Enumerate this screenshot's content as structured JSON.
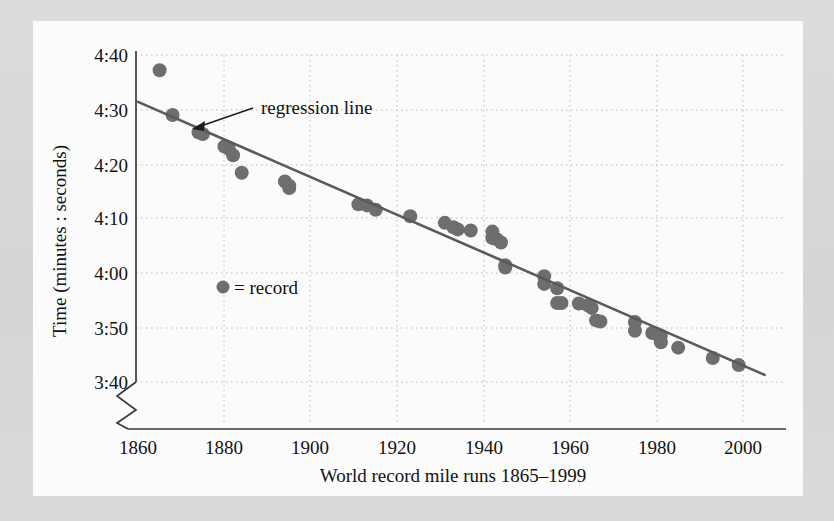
{
  "figure": {
    "panel_background": "#fbfbfb",
    "page_background": "#d9d9d9"
  },
  "chart_data": {
    "type": "scatter",
    "title": "",
    "xlabel": "World record mile runs 1865–1999",
    "ylabel": "Time (minutes : seconds)",
    "xlim": [
      1858,
      2006
    ],
    "ylim": [
      218,
      282
    ],
    "ylim_note": "y values in seconds; 3:40 = 220 s, 4:40 = 280 s",
    "grid": true,
    "grid_style": "dotted",
    "y_axis_break": true,
    "xticks": [
      1860,
      1880,
      1900,
      1920,
      1940,
      1960,
      1980,
      2000
    ],
    "xticklabels": [
      "1860",
      "1880",
      "1900",
      "1920",
      "1940",
      "1960",
      "1980",
      "2000"
    ],
    "yticks": [
      280,
      270,
      260,
      250,
      240,
      230,
      220
    ],
    "yticklabels": [
      "4:40",
      "4:30",
      "4:20",
      "4:10",
      "4:00",
      "3:50",
      "3:40"
    ],
    "marker_color": "#6e6e6e",
    "line_color": "#5a5a5a",
    "series": [
      {
        "name": "record",
        "marker": "filled-circle",
        "points": [
          {
            "x": 1865,
            "y": 277.2
          },
          {
            "x": 1868,
            "y": 269.0
          },
          {
            "x": 1874,
            "y": 265.8
          },
          {
            "x": 1875,
            "y": 265.5
          },
          {
            "x": 1880,
            "y": 263.2
          },
          {
            "x": 1881,
            "y": 262.8
          },
          {
            "x": 1882,
            "y": 261.6
          },
          {
            "x": 1884,
            "y": 258.4
          },
          {
            "x": 1894,
            "y": 256.8
          },
          {
            "x": 1895,
            "y": 256.0
          },
          {
            "x": 1895,
            "y": 255.6
          },
          {
            "x": 1911,
            "y": 252.6
          },
          {
            "x": 1913,
            "y": 252.4
          },
          {
            "x": 1915,
            "y": 251.6
          },
          {
            "x": 1923,
            "y": 250.4
          },
          {
            "x": 1931,
            "y": 249.2
          },
          {
            "x": 1933,
            "y": 248.4
          },
          {
            "x": 1934,
            "y": 248.0
          },
          {
            "x": 1937,
            "y": 247.8
          },
          {
            "x": 1942,
            "y": 247.6
          },
          {
            "x": 1942,
            "y": 246.4
          },
          {
            "x": 1943,
            "y": 246.2
          },
          {
            "x": 1944,
            "y": 245.6
          },
          {
            "x": 1945,
            "y": 241.4
          },
          {
            "x": 1945,
            "y": 241.0
          },
          {
            "x": 1954,
            "y": 239.4
          },
          {
            "x": 1954,
            "y": 238.0
          },
          {
            "x": 1957,
            "y": 237.2
          },
          {
            "x": 1957,
            "y": 234.5
          },
          {
            "x": 1958,
            "y": 234.5
          },
          {
            "x": 1962,
            "y": 234.4
          },
          {
            "x": 1964,
            "y": 234.1
          },
          {
            "x": 1965,
            "y": 233.6
          },
          {
            "x": 1966,
            "y": 231.3
          },
          {
            "x": 1967,
            "y": 231.1
          },
          {
            "x": 1975,
            "y": 231.0
          },
          {
            "x": 1975,
            "y": 229.4
          },
          {
            "x": 1979,
            "y": 229.0
          },
          {
            "x": 1980,
            "y": 228.8
          },
          {
            "x": 1981,
            "y": 228.5
          },
          {
            "x": 1981,
            "y": 227.3
          },
          {
            "x": 1985,
            "y": 226.3
          },
          {
            "x": 1993,
            "y": 224.4
          },
          {
            "x": 1999,
            "y": 223.1
          }
        ]
      }
    ],
    "fit_line": {
      "name": "regression line",
      "x_start": 1860,
      "y_start": 271.4,
      "x_end": 2005,
      "y_end": 221.3
    },
    "annotations": [
      {
        "name": "regression-line-annotation",
        "text": "regression line",
        "arrow": true
      }
    ],
    "legend": {
      "position": "inside-left",
      "entries": [
        {
          "marker": "filled-circle",
          "text": "= record"
        }
      ]
    }
  }
}
